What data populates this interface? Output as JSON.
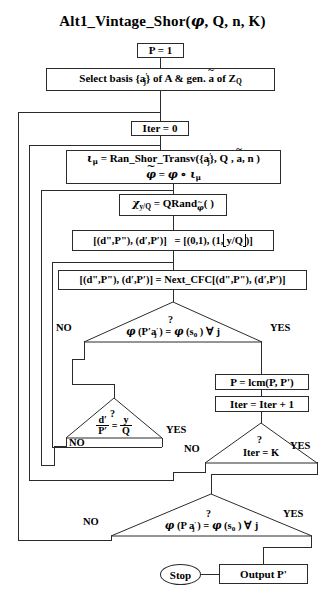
{
  "title": {
    "name": "Alt1_Vintage_Shor(",
    "args": "φ, Q, n, K",
    "close": ")"
  },
  "nodes": {
    "init_p": "P = 1",
    "select_basis_pre": "Select basis {a",
    "select_basis_mid": "} of A & gen. ",
    "select_basis_a": "ã",
    "select_basis_post": " of ",
    "select_basis_z": "Z",
    "select_basis_zq": "Q",
    "iter_zero": "Iter = 0",
    "ran_shor_line1": "ι",
    "ran_shor_line1b": " = Ran_Shor_Transv({a",
    "ran_shor_line1c": "}, Q , ã, n )",
    "ran_shor_line2": "φ̃ = φ ∘ ι",
    "qrand_chi": "χ",
    "qrand_sub": "y/Q",
    "qrand_eq": " = QRand",
    "qrand_phi": "φ̃",
    "qrand_paren": "( )",
    "cfc_init_left": "[(d\",P\"), (d',P')]",
    "cfc_init_right": "= [(0,1), (1,",
    "cfc_init_floor": "y/Q",
    "cfc_init_end": ")]",
    "next_cfc": "[(d\",P\"), (d',P')] = Next_CFC[(d\",P\"), (d',P')]",
    "lcm": "P = lcm(P, P')",
    "iter_inc": "Iter = Iter + 1",
    "stop": "Stop",
    "output": "Output  P'"
  },
  "decisions": {
    "phi_pprime": {
      "text": "φ (P'a'j ) = φ (s0 ) ∀ j",
      "question": "?",
      "no": "NO",
      "yes": "YES"
    },
    "frac_check": {
      "num": "d'",
      "den": "P'",
      "eq": "=",
      "num2": "y",
      "den2": "Q",
      "question": "?",
      "no": "NO",
      "yes": "YES"
    },
    "iter_k": {
      "text": "Iter = K",
      "question": "?",
      "no": "NO",
      "yes": "YES"
    },
    "phi_p": {
      "text": "φ (P a'j ) = φ (s0 ) ∀ j",
      "question": "?",
      "no": "NO",
      "yes": "YES"
    }
  },
  "symbols": {
    "phi": "φ",
    "iota": "ι",
    "mu": "μ",
    "chi": "χ",
    "forall": "∀",
    "compose": "∘",
    "prime": "'",
    "aj": "a'j",
    "s0": "s0"
  },
  "colors": {
    "stroke": "#2b2b2b",
    "background": "#ffffff",
    "text": "#000000"
  }
}
